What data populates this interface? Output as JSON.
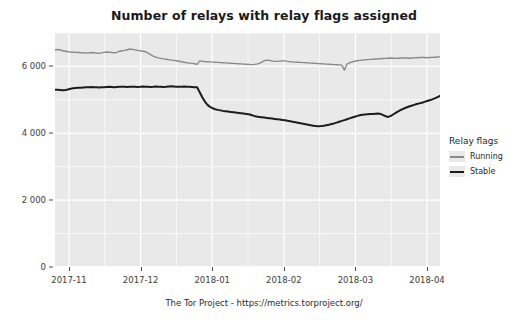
{
  "chart_data": {
    "type": "line",
    "title": "Number of relays with relay flags assigned",
    "xlabel": "",
    "ylabel": "",
    "ylim": [
      0,
      7000
    ],
    "yticks": [
      0,
      2000,
      4000,
      6000
    ],
    "ytick_labels": [
      "0",
      "2 000",
      "4 000",
      "6 000"
    ],
    "xticks": [
      "2017-11",
      "2017-12",
      "2018-01",
      "2018-02",
      "2018-03",
      "2018-04"
    ],
    "xlim": [
      "2017-10-20",
      "2018-04-05"
    ],
    "grid": true,
    "grid_color": "#ffffff",
    "panel_color": "#e9e9e9",
    "legend_position": "right",
    "legend_title": "Relay flags",
    "series": [
      {
        "name": "Running",
        "color": "#8a8a8a",
        "values": [
          6500,
          6505,
          6490,
          6470,
          6455,
          6440,
          6430,
          6425,
          6420,
          6415,
          6410,
          6405,
          6400,
          6405,
          6415,
          6410,
          6400,
          6395,
          6405,
          6420,
          6430,
          6425,
          6415,
          6410,
          6420,
          6455,
          6470,
          6480,
          6500,
          6520,
          6510,
          6495,
          6480,
          6470,
          6455,
          6440,
          6400,
          6355,
          6310,
          6280,
          6255,
          6240,
          6225,
          6215,
          6200,
          6190,
          6180,
          6170,
          6155,
          6140,
          6125,
          6110,
          6100,
          6090,
          6080,
          6060,
          6165,
          6155,
          6145,
          6140,
          6135,
          6130,
          6125,
          6120,
          6115,
          6110,
          6105,
          6100,
          6095,
          6090,
          6085,
          6080,
          6075,
          6070,
          6065,
          6060,
          6055,
          6060,
          6070,
          6090,
          6130,
          6175,
          6190,
          6180,
          6165,
          6155,
          6150,
          6160,
          6170,
          6165,
          6150,
          6140,
          6135,
          6130,
          6125,
          6120,
          6115,
          6110,
          6105,
          6100,
          6095,
          6090,
          6085,
          6080,
          6075,
          6070,
          6065,
          6060,
          6055,
          6050,
          6045,
          6040,
          5890,
          6070,
          6110,
          6135,
          6155,
          6170,
          6180,
          6190,
          6200,
          6205,
          6210,
          6215,
          6220,
          6225,
          6230,
          6235,
          6240,
          6245,
          6250,
          6245,
          6240,
          6245,
          6250,
          6255,
          6250,
          6245,
          6250,
          6255,
          6260,
          6265,
          6270,
          6265,
          6260,
          6265,
          6270,
          6275,
          6280,
          6285
        ],
        "start_value": 6500,
        "end_value": 6285,
        "min_value": 5890,
        "max_value": 6520
      },
      {
        "name": "Stable",
        "color": "#1c1c1c",
        "values": [
          5300,
          5305,
          5295,
          5285,
          5295,
          5310,
          5330,
          5345,
          5355,
          5360,
          5365,
          5370,
          5375,
          5380,
          5385,
          5380,
          5375,
          5370,
          5375,
          5380,
          5385,
          5390,
          5385,
          5380,
          5385,
          5390,
          5395,
          5390,
          5385,
          5390,
          5395,
          5390,
          5385,
          5390,
          5400,
          5395,
          5390,
          5385,
          5390,
          5400,
          5395,
          5390,
          5385,
          5390,
          5400,
          5405,
          5400,
          5395,
          5390,
          5395,
          5400,
          5395,
          5390,
          5385,
          5380,
          5375,
          5230,
          5080,
          4950,
          4850,
          4790,
          4750,
          4720,
          4700,
          4685,
          4670,
          4660,
          4650,
          4640,
          4630,
          4620,
          4610,
          4600,
          4590,
          4580,
          4570,
          4545,
          4520,
          4500,
          4490,
          4480,
          4470,
          4460,
          4450,
          4440,
          4430,
          4420,
          4410,
          4400,
          4390,
          4375,
          4360,
          4345,
          4330,
          4315,
          4300,
          4285,
          4270,
          4255,
          4240,
          4225,
          4215,
          4210,
          4215,
          4225,
          4240,
          4255,
          4275,
          4295,
          4320,
          4345,
          4370,
          4395,
          4420,
          4445,
          4470,
          4495,
          4520,
          4540,
          4555,
          4565,
          4570,
          4575,
          4580,
          4585,
          4590,
          4580,
          4545,
          4510,
          4490,
          4520,
          4570,
          4620,
          4665,
          4705,
          4740,
          4770,
          4800,
          4825,
          4850,
          4875,
          4895,
          4915,
          4940,
          4965,
          4990,
          5015,
          5045,
          5080,
          5120
        ],
        "start_value": 5300,
        "end_value": 5120,
        "min_value": 4210,
        "max_value": 5405
      }
    ]
  },
  "legend": {
    "title": "Relay flags",
    "items": [
      {
        "label": "Running",
        "color": "#8a8a8a"
      },
      {
        "label": "Stable",
        "color": "#1c1c1c"
      }
    ]
  },
  "footer": {
    "caption": "The Tor Project - https://metrics.torproject.org/"
  }
}
